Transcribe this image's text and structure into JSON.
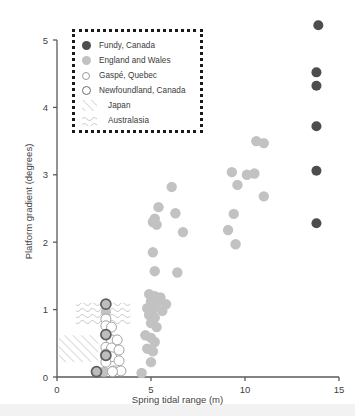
{
  "chart_data": {
    "type": "scatter",
    "title": "",
    "xlabel": "Spring tidal range (m)",
    "ylabel": "Platform gradient (degrees)",
    "xlim": [
      0,
      15
    ],
    "ylim": [
      0,
      5
    ],
    "xticks": [
      0,
      5,
      10,
      15
    ],
    "yticks": [
      0,
      1,
      2,
      3,
      4,
      5
    ],
    "grid": false,
    "legend_position": "top-left",
    "legend_entries": [
      {
        "label": "Fundy, Canada",
        "marker": "filled-dark-circle",
        "color": "#4d4d4d"
      },
      {
        "label": "England and Wales",
        "marker": "filled-gray-circle",
        "color": "#c2c2c2"
      },
      {
        "label": "Gaspé, Quebec",
        "marker": "open-circle",
        "color": "#ffffff"
      },
      {
        "label": "Newfoundland, Canada",
        "marker": "thick-ring-circle",
        "color": "#6b6b6b"
      },
      {
        "label": "Japan",
        "marker": "diagonal-hatch-region",
        "color": "#c9c9c9"
      },
      {
        "label": "Australasia",
        "marker": "wavy-hatch-region",
        "color": "#c9c9c9"
      }
    ],
    "series": [
      {
        "name": "Fundy, Canada",
        "marker": "filled-dark-circle",
        "color": "#4d4d4d",
        "points": [
          [
            13.9,
            5.22
          ],
          [
            13.8,
            4.52
          ],
          [
            13.8,
            4.32
          ],
          [
            13.8,
            3.72
          ],
          [
            13.8,
            3.06
          ],
          [
            13.8,
            2.28
          ]
        ]
      },
      {
        "name": "England and Wales",
        "marker": "filled-gray-circle",
        "color": "#c2c2c2",
        "points": [
          [
            10.6,
            3.5
          ],
          [
            11.0,
            3.47
          ],
          [
            9.3,
            3.04
          ],
          [
            10.1,
            3.0
          ],
          [
            10.5,
            3.02
          ],
          [
            9.6,
            2.85
          ],
          [
            11.0,
            2.68
          ],
          [
            9.4,
            2.42
          ],
          [
            9.1,
            2.18
          ],
          [
            9.5,
            1.97
          ],
          [
            6.1,
            2.82
          ],
          [
            5.4,
            2.52
          ],
          [
            6.3,
            2.43
          ],
          [
            5.2,
            2.35
          ],
          [
            5.1,
            2.3
          ],
          [
            5.3,
            2.26
          ],
          [
            6.7,
            2.15
          ],
          [
            5.1,
            1.85
          ],
          [
            5.2,
            1.57
          ],
          [
            6.4,
            1.55
          ],
          [
            4.9,
            1.23
          ],
          [
            5.2,
            1.2
          ],
          [
            5.5,
            1.18
          ],
          [
            5.0,
            1.12
          ],
          [
            5.3,
            1.1
          ],
          [
            5.8,
            1.08
          ],
          [
            4.8,
            1.02
          ],
          [
            5.1,
            1.0
          ],
          [
            5.6,
            0.98
          ],
          [
            4.9,
            0.92
          ],
          [
            5.2,
            0.88
          ],
          [
            5.0,
            0.8
          ],
          [
            5.3,
            0.74
          ],
          [
            4.7,
            0.62
          ],
          [
            5.0,
            0.58
          ],
          [
            5.2,
            0.52
          ],
          [
            4.8,
            0.42
          ],
          [
            5.1,
            0.38
          ],
          [
            5.0,
            0.22
          ],
          [
            4.5,
            0.06
          ],
          [
            2.6,
            0.96
          ],
          [
            2.6,
            0.63
          ],
          [
            2.5,
            0.08
          ],
          [
            2.1,
            0.08
          ]
        ]
      },
      {
        "name": "Gaspé, Quebec",
        "marker": "open-circle",
        "color": "#ffffff",
        "points": [
          [
            2.6,
            0.86
          ],
          [
            2.6,
            0.76
          ],
          [
            2.9,
            0.74
          ],
          [
            2.9,
            0.55
          ],
          [
            3.2,
            0.55
          ],
          [
            2.6,
            0.44
          ],
          [
            2.9,
            0.43
          ],
          [
            3.3,
            0.4
          ],
          [
            2.6,
            0.34
          ],
          [
            2.9,
            0.3
          ],
          [
            3.3,
            0.24
          ],
          [
            2.6,
            0.22
          ],
          [
            3.0,
            0.09
          ],
          [
            3.4,
            0.09
          ],
          [
            2.95,
            0.08
          ]
        ]
      },
      {
        "name": "Newfoundland, Canada",
        "marker": "thick-ring-circle",
        "color": "#6b6b6b",
        "points": [
          [
            2.6,
            1.08
          ],
          [
            2.6,
            0.63
          ],
          [
            2.6,
            0.32
          ],
          [
            2.1,
            0.08
          ]
        ]
      }
    ],
    "regions": [
      {
        "name": "Japan",
        "pattern": "diagonal-hatch",
        "x0": 0.1,
        "x1": 2.2,
        "y0": 0.22,
        "y1": 0.62
      },
      {
        "name": "Australasia",
        "pattern": "wavy-hatch",
        "x0": 1.0,
        "x1": 3.9,
        "y0": 0.78,
        "y1": 1.1
      }
    ]
  }
}
